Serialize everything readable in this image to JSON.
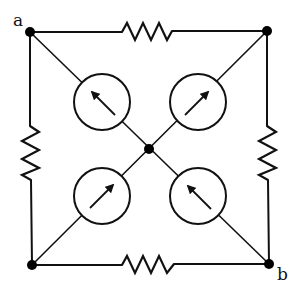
{
  "diagram": {
    "type": "circuit-bridge",
    "colors": {
      "ink": "#111111",
      "background": "#ffffff"
    },
    "terminals": [
      {
        "id": "a",
        "label": "a",
        "position": "top-left"
      },
      {
        "id": "b",
        "label": "b",
        "position": "bottom-right"
      }
    ],
    "nodes": [
      {
        "id": "top-left",
        "terminal": "a"
      },
      {
        "id": "top-right"
      },
      {
        "id": "bottom-left"
      },
      {
        "id": "bottom-right",
        "terminal": "b"
      },
      {
        "id": "center"
      }
    ],
    "resistors": [
      {
        "id": "R-top",
        "between": [
          "top-left",
          "top-right"
        ]
      },
      {
        "id": "R-left",
        "between": [
          "top-left",
          "bottom-left"
        ]
      },
      {
        "id": "R-right",
        "between": [
          "top-right",
          "bottom-right"
        ]
      },
      {
        "id": "R-bottom",
        "between": [
          "bottom-left",
          "bottom-right"
        ]
      }
    ],
    "current_sources": [
      {
        "id": "I-upper-left",
        "between": [
          "top-left",
          "center"
        ],
        "arrow_direction": "toward top-left"
      },
      {
        "id": "I-upper-right",
        "between": [
          "center",
          "top-right"
        ],
        "arrow_direction": "toward top-right"
      },
      {
        "id": "I-lower-left",
        "between": [
          "bottom-left",
          "center"
        ],
        "arrow_direction": "toward center"
      },
      {
        "id": "I-lower-right",
        "between": [
          "bottom-right",
          "center"
        ],
        "arrow_direction": "toward center"
      }
    ]
  }
}
